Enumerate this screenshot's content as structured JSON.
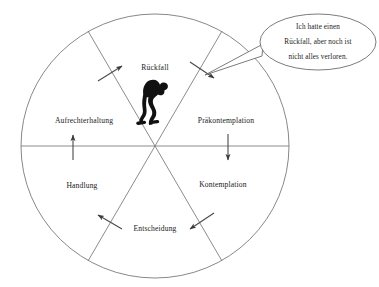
{
  "diagram": {
    "center": {
      "x": 155,
      "y": 146
    },
    "radius": 134,
    "colors": {
      "outline": "#7a7a7a",
      "divider": "#6e6e6e",
      "arrow": "#4a4a4a",
      "figure": "#111111",
      "bubble_stroke": "#5a5a5a",
      "text": "#1a1a1a",
      "background": "#ffffff"
    },
    "sectors": [
      {
        "id": "rueckfall",
        "label": "Rückfall",
        "label_x": 155,
        "label_y": 68
      },
      {
        "id": "praekontemplation",
        "label": "Präkontemplation",
        "label_x": 226,
        "label_y": 121
      },
      {
        "id": "kontemplation",
        "label": "Kontemplation",
        "label_x": 223,
        "label_y": 185
      },
      {
        "id": "entscheidung",
        "label": "Entscheidung",
        "label_x": 155,
        "label_y": 229
      },
      {
        "id": "handlung",
        "label": "Handlung",
        "label_x": 82,
        "label_y": 186
      },
      {
        "id": "aufrechterhaltung",
        "label": "Aufrechterhaltung",
        "label_x": 84,
        "label_y": 121
      }
    ],
    "arrows": [
      {
        "id": "arrow-upper-left",
        "direction": "up-right",
        "x1": 98,
        "y1": 81,
        "x2": 122,
        "y2": 66
      },
      {
        "id": "arrow-upper-right",
        "direction": "down-right",
        "x1": 190,
        "y1": 62,
        "x2": 214,
        "y2": 78
      },
      {
        "id": "arrow-mid-left",
        "direction": "up",
        "x1": 73,
        "y1": 160,
        "x2": 73,
        "y2": 135
      },
      {
        "id": "arrow-mid-right",
        "direction": "down",
        "x1": 228,
        "y1": 134,
        "x2": 228,
        "y2": 160
      },
      {
        "id": "arrow-lower-left",
        "direction": "up-left",
        "x1": 122,
        "y1": 229,
        "x2": 98,
        "y2": 215
      },
      {
        "id": "arrow-lower-right",
        "direction": "down-left",
        "x1": 214,
        "y1": 213,
        "x2": 190,
        "y2": 229
      }
    ],
    "figure": {
      "id": "hunched-person",
      "description": "hunched person silhouette"
    }
  },
  "speech_bubble": {
    "lines": [
      "Ich hatte einen",
      "Rückfall, aber noch ist",
      "nicht alles verloren."
    ],
    "full_text": "Ich hatte einen Rückfall, aber noch ist nicht alles verloren.",
    "center_x": 318,
    "center_y": 42,
    "rx": 58,
    "ry": 28
  }
}
